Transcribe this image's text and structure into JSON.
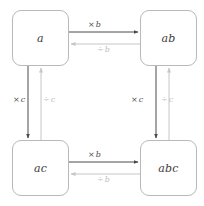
{
  "diagram": {
    "type": "commutative-grid",
    "background_color": "#ffffff",
    "node_border_color": "#b9b9b9",
    "forward_arrow_color": "#4a4a4a",
    "inverse_arrow_color": "#c6c6c6",
    "nodes": [
      {
        "id": "a",
        "label": "a"
      },
      {
        "id": "ab",
        "label": "ab"
      },
      {
        "id": "ac",
        "label": "ac"
      },
      {
        "id": "abc",
        "label": "abc"
      }
    ],
    "edges": {
      "top_forward": {
        "op": "×",
        "symbol": "b",
        "direction": "right",
        "style": "dark"
      },
      "top_inverse": {
        "op": "÷",
        "symbol": "b",
        "direction": "left",
        "style": "light"
      },
      "bottom_forward": {
        "op": "×",
        "symbol": "b",
        "direction": "right",
        "style": "dark"
      },
      "bottom_inverse": {
        "op": "÷",
        "symbol": "b",
        "direction": "left",
        "style": "light"
      },
      "left_forward": {
        "op": "×",
        "symbol": "c",
        "direction": "down",
        "style": "dark"
      },
      "left_inverse": {
        "op": "÷",
        "symbol": "c",
        "direction": "up",
        "style": "light"
      },
      "right_forward": {
        "op": "×",
        "symbol": "c",
        "direction": "down",
        "style": "dark"
      },
      "right_inverse": {
        "op": "÷",
        "symbol": "c",
        "direction": "up",
        "style": "light"
      }
    }
  }
}
